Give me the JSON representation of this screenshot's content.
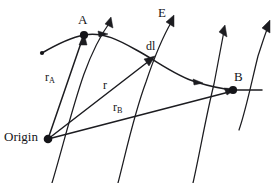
{
  "figure": {
    "labels": {
      "point_a": "A",
      "point_b": "B",
      "field": "E",
      "path_element": "dl",
      "vector_a": "r",
      "vector_a_sub": "A",
      "vector_p": "r",
      "vector_b": "r",
      "vector_b_sub": "B",
      "origin": "Origin"
    },
    "colors": {
      "ink": "#1c1c20",
      "background": "#ffffff"
    },
    "geometry": {
      "origin_point": [
        48,
        139
      ],
      "point_a": [
        84,
        35
      ],
      "point_b": [
        233,
        90
      ],
      "dl_point": [
        152,
        57
      ],
      "field_line_count": 4,
      "path_start": [
        42,
        53
      ],
      "path_end": [
        262,
        90
      ]
    }
  }
}
